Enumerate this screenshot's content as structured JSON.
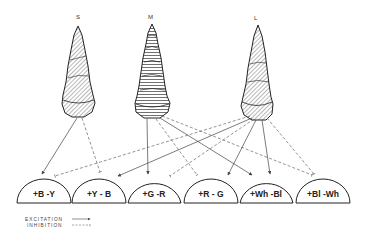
{
  "diagram": {
    "type": "color-opponent-wiring",
    "cones": [
      {
        "id": "S",
        "label": "S",
        "x": 78,
        "hatch": "diagonal"
      },
      {
        "id": "M",
        "label": "M",
        "x": 152,
        "hatch": "horizontal"
      },
      {
        "id": "L",
        "label": "L",
        "x": 257,
        "hatch": "diagonal"
      }
    ],
    "cells": [
      {
        "id": "by",
        "label": "+B -Y",
        "cx": 44
      },
      {
        "id": "yb",
        "label": "+Y - B",
        "cx": 99
      },
      {
        "id": "gr",
        "label": "+G -R",
        "cx": 154
      },
      {
        "id": "rg",
        "label": "+R - G",
        "cx": 211
      },
      {
        "id": "whbl",
        "label": "+Wh -Bl",
        "cx": 266
      },
      {
        "id": "blwh",
        "label": "+Bl -Wh",
        "cx": 323
      }
    ],
    "connections": [
      {
        "from": "S",
        "to": "by",
        "type": "excitation"
      },
      {
        "from": "S",
        "to": "yb",
        "type": "inhibition"
      },
      {
        "from": "M",
        "to": "gr",
        "type": "excitation"
      },
      {
        "from": "M",
        "to": "rg",
        "type": "inhibition"
      },
      {
        "from": "M",
        "to": "whbl",
        "type": "excitation"
      },
      {
        "from": "M",
        "to": "blwh",
        "type": "inhibition"
      },
      {
        "from": "L",
        "to": "by",
        "type": "inhibition"
      },
      {
        "from": "L",
        "to": "yb",
        "type": "excitation"
      },
      {
        "from": "L",
        "to": "gr",
        "type": "inhibition"
      },
      {
        "from": "L",
        "to": "rg",
        "type": "excitation"
      },
      {
        "from": "L",
        "to": "whbl",
        "type": "excitation"
      },
      {
        "from": "L",
        "to": "blwh",
        "type": "inhibition"
      }
    ],
    "legend": {
      "excitation": "EXCITATION",
      "inhibition": "INHIBITION"
    }
  }
}
